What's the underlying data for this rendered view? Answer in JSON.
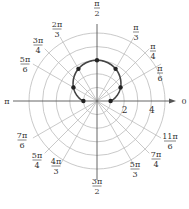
{
  "chart_data": {
    "type": "polar",
    "title": "",
    "equation_implied": "r = 1 + 2 sin(theta)",
    "origin_px": [
      97,
      101
    ],
    "unit_px": 13.6,
    "grid_circles": [
      1,
      2,
      3,
      4,
      5
    ],
    "radial_labels": [
      {
        "value": 2,
        "text": "2"
      },
      {
        "value": 4,
        "text": "4"
      }
    ],
    "angle_labels": [
      {
        "angle_deg": 0,
        "num": "0",
        "den": ""
      },
      {
        "angle_deg": 30,
        "num": "π",
        "den": "6"
      },
      {
        "angle_deg": 45,
        "num": "π",
        "den": "4"
      },
      {
        "angle_deg": 60,
        "num": "π",
        "den": "3"
      },
      {
        "angle_deg": 90,
        "num": "π",
        "den": "2"
      },
      {
        "angle_deg": 120,
        "num": "2π",
        "den": "3"
      },
      {
        "angle_deg": 135,
        "num": "3π",
        "den": "4"
      },
      {
        "angle_deg": 150,
        "num": "5π",
        "den": "6"
      },
      {
        "angle_deg": 180,
        "num": "π",
        "den": ""
      },
      {
        "angle_deg": 210,
        "num": "7π",
        "den": "6"
      },
      {
        "angle_deg": 225,
        "num": "5π",
        "den": "4"
      },
      {
        "angle_deg": 240,
        "num": "4π",
        "den": "3"
      },
      {
        "angle_deg": 270,
        "num": "3π",
        "den": "2"
      },
      {
        "angle_deg": 300,
        "num": "5π",
        "den": "3"
      },
      {
        "angle_deg": 315,
        "num": "7π",
        "den": "4"
      },
      {
        "angle_deg": 330,
        "num": "11π",
        "den": "6"
      }
    ],
    "points": [
      {
        "theta": "0",
        "theta_deg": 0,
        "r": 1
      },
      {
        "theta": "π/6",
        "theta_deg": 30,
        "r": 2
      },
      {
        "theta": "π/3",
        "theta_deg": 60,
        "r": 2.73
      },
      {
        "theta": "π/2",
        "theta_deg": 90,
        "r": 3
      },
      {
        "theta": "2π/3",
        "theta_deg": 120,
        "r": 2.73
      },
      {
        "theta": "5π/6",
        "theta_deg": 150,
        "r": 2
      },
      {
        "theta": "π",
        "theta_deg": 180,
        "r": 1
      }
    ],
    "curve_theta_range_deg": [
      0,
      180
    ],
    "colors": {
      "grid": "#bbbbbb",
      "axis": "#555555",
      "curve": "#444444",
      "points": "#222222",
      "text": "#333333"
    }
  }
}
